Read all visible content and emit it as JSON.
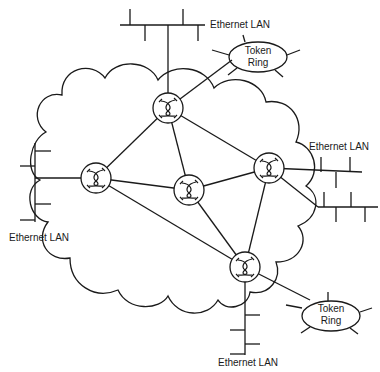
{
  "diagram": {
    "type": "network-topology",
    "colors": {
      "stroke": "#1a1a1a",
      "background": "#ffffff"
    },
    "cloud": {
      "label": ""
    },
    "routers": [
      {
        "id": "r1",
        "x": 168,
        "y": 108
      },
      {
        "id": "r2",
        "x": 96,
        "y": 178
      },
      {
        "id": "r3",
        "x": 189,
        "y": 190
      },
      {
        "id": "r4",
        "x": 269,
        "y": 168
      },
      {
        "id": "r5",
        "x": 245,
        "y": 267
      }
    ],
    "links": [
      [
        "r1",
        "r2"
      ],
      [
        "r1",
        "r3"
      ],
      [
        "r1",
        "r4"
      ],
      [
        "r2",
        "r3"
      ],
      [
        "r2",
        "r5"
      ],
      [
        "r3",
        "r4"
      ],
      [
        "r3",
        "r5"
      ],
      [
        "r4",
        "r5"
      ]
    ],
    "networks": {
      "top_ethernet": {
        "label": "Ethernet LAN"
      },
      "top_token_ring": {
        "line1": "Token",
        "line2": "Ring"
      },
      "left_ethernet": {
        "label": "Ethernet LAN"
      },
      "right_ethernet": {
        "label": "Ethernet LAN"
      },
      "bottom_ethernet": {
        "label": "Ethernet LAN"
      },
      "bottom_token_ring": {
        "line1": "Token",
        "line2": "Ring"
      }
    }
  }
}
